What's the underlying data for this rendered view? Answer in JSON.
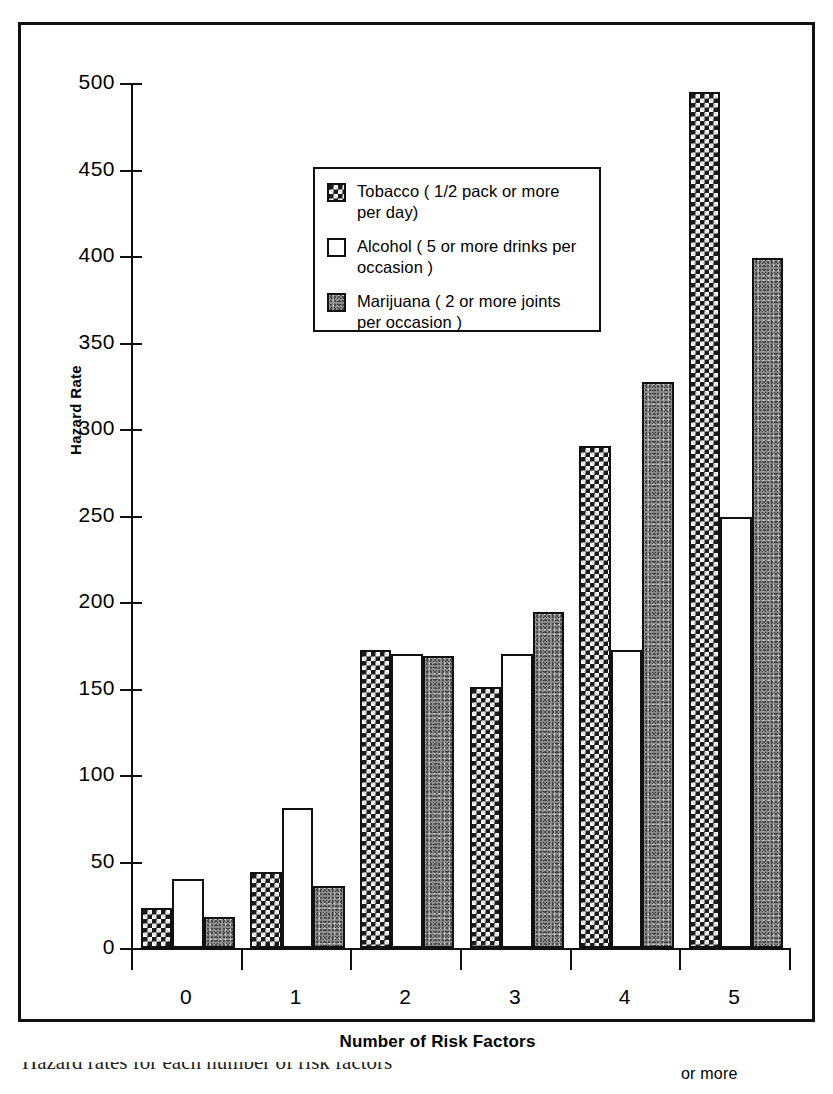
{
  "chart_data": {
    "type": "bar",
    "title": "",
    "xlabel": "Number of Risk Factors",
    "xlabel_note": "or more",
    "ylabel": "Hazard Rate",
    "categories": [
      "0",
      "1",
      "2",
      "3",
      "4",
      "5"
    ],
    "ylim": [
      0,
      500
    ],
    "yticks": [
      0,
      50,
      100,
      150,
      200,
      250,
      300,
      350,
      400,
      450,
      500
    ],
    "ytick_labels": [
      "0",
      "50",
      "100",
      "150",
      "200",
      "250",
      "300",
      "350",
      "400",
      "450",
      "500"
    ],
    "grid": false,
    "legend_position": "upper-center",
    "series": [
      {
        "name": "Tobacco",
        "legend_label": "Tobacco ( 1/2 pack or more per day)",
        "legend_line1": "Tobacco ( 1/2 pack or more",
        "legend_line2": "per day)",
        "pattern": "dark-checkerboard",
        "values": [
          23,
          44,
          172,
          151,
          290,
          495
        ]
      },
      {
        "name": "Alcohol",
        "legend_label": "Alcohol ( 5 or more drinks per occasion )",
        "legend_line1": "Alcohol ( 5 or more drinks per",
        "legend_line2": "occasion )",
        "pattern": "white",
        "values": [
          40,
          81,
          170,
          170,
          172,
          249
        ]
      },
      {
        "name": "Marijuana",
        "legend_label": "Marijuana ( 2 or more joints per occasion )",
        "legend_line1": "Marijuana ( 2 or more joints",
        "legend_line2": "per occasion )",
        "pattern": "gray-stipple",
        "values": [
          18,
          36,
          169,
          194,
          327,
          399
        ]
      }
    ]
  },
  "caption_partial": "Hazard rates for each number of risk factors"
}
